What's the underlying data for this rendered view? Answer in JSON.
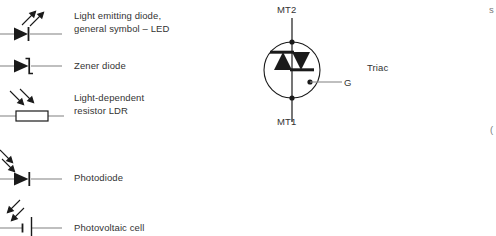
{
  "figure": {
    "kind": "electronic-component-symbols",
    "background": "#ffffff",
    "ink": "#1a1a1a",
    "text_color": "#333333",
    "lead_color": "#8a8a8a"
  },
  "left_column": {
    "items": [
      {
        "symbol": "led-symbol",
        "label": "Light emitting diode,\ngeneral symbol  –  LED",
        "label_lines": [
          "Light emitting diode,",
          "general symbol  –  LED"
        ]
      },
      {
        "symbol": "zener-diode-symbol",
        "label": "Zener diode",
        "label_lines": [
          "Zener diode"
        ]
      },
      {
        "symbol": "ldr-symbol",
        "label": "Light-dependent\nresistor LDR",
        "label_lines": [
          "Light-dependent",
          "resistor LDR"
        ]
      },
      {
        "symbol": "photodiode-symbol",
        "label": "Photodiode",
        "label_lines": [
          "Photodiode"
        ]
      },
      {
        "symbol": "photovoltaic-cell-symbol",
        "label": "Photovoltaic cell",
        "label_lines": [
          "Photovoltaic cell"
        ]
      }
    ]
  },
  "triac": {
    "name": "Triac",
    "terminal_top": "MT2",
    "terminal_bottom": "MT1",
    "terminal_gate": "G",
    "caption": "Triac"
  },
  "edge_fragments": {
    "top_right": "s",
    "mid_right": "("
  }
}
